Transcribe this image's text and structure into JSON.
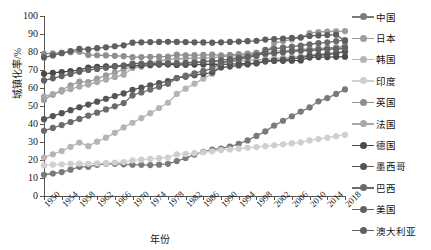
{
  "chart_data": {
    "type": "line",
    "title": "",
    "xlabel": "年份",
    "ylabel": "城镇化率/%",
    "xlim": [
      1950,
      2018
    ],
    "ylim": [
      0,
      100
    ],
    "ytick_step": 10,
    "xtick_step": 4,
    "grid": false,
    "legend_position": "right",
    "ytick_labels": [
      "0",
      "10",
      "20",
      "30",
      "40",
      "50",
      "60",
      "70",
      "80",
      "90",
      "100"
    ],
    "ytick_values": [
      0,
      10,
      20,
      30,
      40,
      50,
      60,
      70,
      80,
      90,
      100
    ],
    "xtick_labels": [
      "1950",
      "1954",
      "1958",
      "1962",
      "1966",
      "1970",
      "1974",
      "1978",
      "1982",
      "1986",
      "1990",
      "1994",
      "1998",
      "2002",
      "2006",
      "2010",
      "2014",
      "2018"
    ],
    "xtick_values": [
      1950,
      1954,
      1958,
      1962,
      1966,
      1970,
      1974,
      1978,
      1982,
      1986,
      1990,
      1994,
      1998,
      2002,
      2006,
      2010,
      2014,
      2018
    ],
    "x": [
      1950,
      1952,
      1954,
      1956,
      1958,
      1960,
      1962,
      1964,
      1966,
      1968,
      1970,
      1972,
      1974,
      1976,
      1978,
      1980,
      1982,
      1984,
      1986,
      1988,
      1990,
      1992,
      1994,
      1996,
      1998,
      2000,
      2002,
      2004,
      2006,
      2008,
      2010,
      2012,
      2014,
      2016,
      2018
    ],
    "series": [
      {
        "name": "中国",
        "color": "#7a7a7a",
        "values": [
          11.8,
          12.5,
          13.3,
          14.6,
          16.2,
          16.2,
          17.3,
          18.0,
          17.9,
          17.6,
          17.4,
          17.3,
          17.2,
          17.4,
          17.9,
          19.4,
          21.1,
          23.0,
          24.5,
          25.8,
          26.4,
          27.5,
          29.0,
          30.9,
          33.4,
          35.9,
          39.1,
          41.8,
          44.3,
          46.9,
          49.2,
          52.6,
          54.4,
          56.7,
          59.2
        ]
      },
      {
        "name": "日本",
        "color": "#9c9c9c",
        "values": [
          53.4,
          56.3,
          58.9,
          61.5,
          63.5,
          63.3,
          65.2,
          67.0,
          68.6,
          70.4,
          71.9,
          73.0,
          74.0,
          75.0,
          75.9,
          76.2,
          76.4,
          76.6,
          76.7,
          76.9,
          77.3,
          77.7,
          78.1,
          78.5,
          78.9,
          78.6,
          85.0,
          86.0,
          87.0,
          88.0,
          90.5,
          91.1,
          91.4,
          91.5,
          91.6
        ]
      },
      {
        "name": "韩国",
        "color": "#b5b5b5",
        "values": [
          21.4,
          23.2,
          25.0,
          27.3,
          29.7,
          27.7,
          30.2,
          32.4,
          35.1,
          38.1,
          40.7,
          43.3,
          46.0,
          48.9,
          51.8,
          56.7,
          59.6,
          62.4,
          65.2,
          67.9,
          73.8,
          75.6,
          77.2,
          78.8,
          79.6,
          79.6,
          80.5,
          80.8,
          81.0,
          81.5,
          81.9,
          81.9,
          81.9,
          81.5,
          81.5
        ]
      },
      {
        "name": "印度",
        "color": "#cfcfcf",
        "values": [
          17.0,
          17.4,
          17.6,
          17.8,
          18.0,
          17.9,
          18.1,
          18.3,
          18.6,
          18.9,
          19.8,
          20.2,
          20.6,
          21.0,
          21.4,
          23.1,
          23.4,
          23.8,
          24.3,
          24.8,
          25.5,
          25.9,
          26.3,
          26.8,
          27.2,
          27.7,
          28.2,
          28.7,
          29.2,
          29.8,
          30.9,
          31.6,
          32.4,
          33.2,
          34.0
        ]
      },
      {
        "name": "英国",
        "color": "#8f8f8f",
        "values": [
          79.0,
          79.3,
          79.6,
          79.9,
          80.2,
          78.4,
          78.2,
          78.1,
          77.9,
          77.7,
          77.1,
          77.2,
          77.3,
          77.4,
          77.5,
          78.5,
          78.2,
          78.3,
          78.4,
          78.5,
          78.1,
          78.4,
          78.8,
          79.1,
          79.5,
          78.7,
          79.3,
          80.0,
          80.7,
          81.4,
          81.3,
          81.9,
          82.3,
          82.6,
          83.4
        ]
      },
      {
        "name": "法国",
        "color": "#a8a8a8",
        "values": [
          55.2,
          56.6,
          58.0,
          59.4,
          60.8,
          61.9,
          63.3,
          64.7,
          66.1,
          67.4,
          71.1,
          71.8,
          72.5,
          73.2,
          73.9,
          73.3,
          73.7,
          74.1,
          74.5,
          74.9,
          74.1,
          74.5,
          74.9,
          75.3,
          75.7,
          75.9,
          76.3,
          76.7,
          77.1,
          77.6,
          78.4,
          78.8,
          79.3,
          79.7,
          80.4
        ]
      },
      {
        "name": "德国",
        "color": "#4a4a4a",
        "values": [
          67.9,
          68.4,
          68.9,
          69.4,
          69.9,
          71.4,
          71.7,
          72.0,
          72.2,
          72.5,
          72.3,
          72.6,
          72.8,
          73.0,
          73.1,
          72.8,
          72.9,
          73.0,
          73.1,
          73.2,
          73.1,
          73.3,
          73.4,
          73.6,
          73.8,
          75.1,
          75.1,
          75.1,
          75.2,
          75.3,
          77.0,
          77.2,
          77.2,
          77.3,
          77.4
        ]
      },
      {
        "name": "墨西哥",
        "color": "#555555",
        "values": [
          42.7,
          44.4,
          46.0,
          47.7,
          49.3,
          50.8,
          52.4,
          54.0,
          55.5,
          57.0,
          59.0,
          60.2,
          61.5,
          62.7,
          63.9,
          65.5,
          66.3,
          67.1,
          67.8,
          68.6,
          71.4,
          71.9,
          72.5,
          73.1,
          73.7,
          74.7,
          75.2,
          75.7,
          76.2,
          76.8,
          77.8,
          78.2,
          78.6,
          79.2,
          80.2
        ]
      },
      {
        "name": "巴西",
        "color": "#6b6b6b",
        "values": [
          36.2,
          37.8,
          39.4,
          41.1,
          42.8,
          44.6,
          46.3,
          48.1,
          49.8,
          51.6,
          55.9,
          57.5,
          59.1,
          60.7,
          62.3,
          65.5,
          66.9,
          68.2,
          69.5,
          70.8,
          73.9,
          74.9,
          75.9,
          76.9,
          77.9,
          81.2,
          81.8,
          82.4,
          83.0,
          83.6,
          84.3,
          84.9,
          85.4,
          86.0,
          86.6
        ]
      },
      {
        "name": "美国",
        "color": "#626262",
        "values": [
          64.2,
          65.4,
          66.6,
          67.8,
          69.0,
          70.0,
          70.6,
          71.2,
          71.8,
          72.4,
          73.6,
          73.6,
          73.6,
          73.6,
          73.7,
          73.7,
          74.0,
          74.3,
          74.6,
          74.9,
          75.3,
          76.0,
          76.8,
          77.5,
          78.3,
          79.1,
          79.5,
          79.9,
          80.3,
          80.7,
          80.8,
          81.2,
          81.5,
          81.8,
          82.3
        ]
      },
      {
        "name": "澳大利亚",
        "color": "#5f5f5f",
        "values": [
          77.0,
          78.1,
          79.3,
          80.5,
          81.7,
          81.5,
          82.1,
          82.6,
          83.2,
          83.7,
          85.2,
          85.4,
          85.5,
          85.6,
          85.7,
          85.6,
          85.5,
          85.4,
          85.3,
          85.2,
          85.4,
          85.6,
          85.8,
          86.0,
          86.2,
          86.9,
          87.2,
          87.5,
          87.8,
          88.1,
          88.9,
          89.2,
          89.4,
          89.6,
          86.0
        ]
      }
    ]
  },
  "axes": {
    "y_title": "城镇化率/%",
    "x_title": "年份"
  },
  "legend": {
    "items": [
      {
        "label": "中国",
        "color": "#7a7a7a"
      },
      {
        "label": "日本",
        "color": "#9c9c9c"
      },
      {
        "label": "韩国",
        "color": "#b5b5b5"
      },
      {
        "label": "印度",
        "color": "#cfcfcf"
      },
      {
        "label": "英国",
        "color": "#8f8f8f"
      },
      {
        "label": "法国",
        "color": "#a8a8a8"
      },
      {
        "label": "德国",
        "color": "#4a4a4a"
      },
      {
        "label": "墨西哥",
        "color": "#555555"
      },
      {
        "label": "巴西",
        "color": "#6b6b6b"
      },
      {
        "label": "美国",
        "color": "#626262"
      },
      {
        "label": "澳大利亚",
        "color": "#5f5f5f"
      }
    ]
  }
}
